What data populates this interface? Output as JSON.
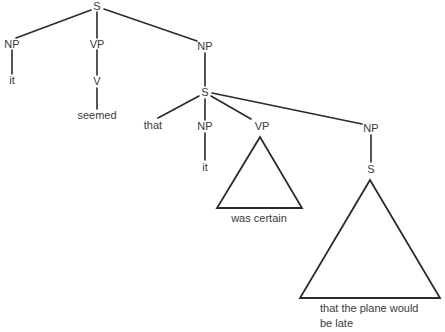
{
  "diagram": {
    "type": "syntax-tree",
    "nodes": [
      {
        "id": "s0",
        "label": "S"
      },
      {
        "id": "np1",
        "label": "NP"
      },
      {
        "id": "it1",
        "label": "it"
      },
      {
        "id": "vp1",
        "label": "VP"
      },
      {
        "id": "v1",
        "label": "V"
      },
      {
        "id": "seemed",
        "label": "seemed"
      },
      {
        "id": "np2",
        "label": "NP"
      },
      {
        "id": "s1",
        "label": "S"
      },
      {
        "id": "that",
        "label": "that"
      },
      {
        "id": "np3",
        "label": "NP"
      },
      {
        "id": "it2",
        "label": "it"
      },
      {
        "id": "vp2",
        "label": "VP"
      },
      {
        "id": "tri1_text",
        "label": "was certain"
      },
      {
        "id": "np4",
        "label": "NP"
      },
      {
        "id": "s2",
        "label": "S"
      },
      {
        "id": "tri2_text_1",
        "label": "that the plane would"
      },
      {
        "id": "tri2_text_2",
        "label": "be late"
      }
    ],
    "edges": [
      [
        "s0",
        "np1"
      ],
      [
        "s0",
        "vp1"
      ],
      [
        "s0",
        "np2"
      ],
      [
        "np1",
        "it1"
      ],
      [
        "vp1",
        "v1"
      ],
      [
        "v1",
        "seemed"
      ],
      [
        "np2",
        "s1"
      ],
      [
        "s1",
        "that"
      ],
      [
        "s1",
        "np3"
      ],
      [
        "s1",
        "vp2"
      ],
      [
        "s1",
        "np4"
      ],
      [
        "np3",
        "it2"
      ],
      [
        "np4",
        "s2"
      ]
    ],
    "triangles": [
      {
        "parent": "vp2",
        "yield": "was certain"
      },
      {
        "parent": "s2",
        "yield": "that the plane would be late"
      }
    ]
  }
}
